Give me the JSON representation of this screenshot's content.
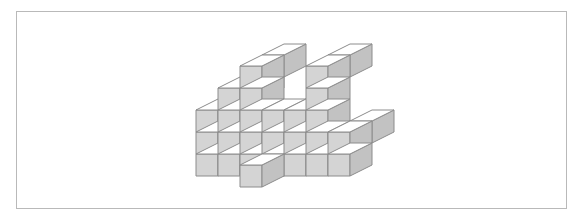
{
  "figure": {
    "title": "",
    "caption": "",
    "kind": "isometric-cube-stack",
    "frame": {
      "visible": true,
      "x": 16,
      "y": 11,
      "width": 551,
      "height": 198,
      "border_color": "#b9b9b9",
      "background": "#ffffff"
    },
    "palette": {
      "top_face": "#ffffff",
      "left_face": "#d4d4d4",
      "right_face": "#c2c2c2",
      "edge": "#8c8c8c",
      "page_background": "#ffffff"
    },
    "projection": {
      "type": "isometric",
      "cube_width_px": 22,
      "cube_height_px": 22,
      "depth_dx_px": 22,
      "depth_dy_px": -11,
      "origin_x_px": 196,
      "origin_y_px": 176
    },
    "cube_count": 38,
    "cubes": [
      {
        "x": 0,
        "y": 0,
        "z": 0
      },
      {
        "x": 0,
        "y": 0,
        "z": 1
      },
      {
        "x": 0,
        "y": 0,
        "z": 2
      },
      {
        "x": 1,
        "y": 0,
        "z": 0
      },
      {
        "x": 1,
        "y": 0,
        "z": 1
      },
      {
        "x": 1,
        "y": 0,
        "z": 2
      },
      {
        "x": 1,
        "y": 0,
        "z": 3
      },
      {
        "x": 2,
        "y": 0,
        "z": 0
      },
      {
        "x": 2,
        "y": 0,
        "z": 1
      },
      {
        "x": 2,
        "y": 0,
        "z": 2
      },
      {
        "x": 2,
        "y": 0,
        "z": 3
      },
      {
        "x": 2,
        "y": 0,
        "z": 4
      },
      {
        "x": 3,
        "y": 0,
        "z": 0
      },
      {
        "x": 3,
        "y": 0,
        "z": 1
      },
      {
        "x": 3,
        "y": 0,
        "z": 2
      },
      {
        "x": 4,
        "y": 0,
        "z": 0
      },
      {
        "x": 4,
        "y": 0,
        "z": 1
      },
      {
        "x": 4,
        "y": 0,
        "z": 2
      },
      {
        "x": 5,
        "y": 0,
        "z": 0
      },
      {
        "x": 5,
        "y": 0,
        "z": 1
      },
      {
        "x": 5,
        "y": 0,
        "z": 2
      },
      {
        "x": 5,
        "y": 0,
        "z": 3
      },
      {
        "x": 5,
        "y": 0,
        "z": 4
      },
      {
        "x": 6,
        "y": 0,
        "z": 0
      },
      {
        "x": 6,
        "y": 0,
        "z": 1
      },
      {
        "x": 3,
        "y": -1,
        "z": 0
      },
      {
        "x": 0,
        "y": 1,
        "z": 2
      },
      {
        "x": 1,
        "y": 1,
        "z": 3
      },
      {
        "x": 2,
        "y": 1,
        "z": 4
      },
      {
        "x": 5,
        "y": 1,
        "z": 4
      },
      {
        "x": 6,
        "y": 1,
        "z": 1
      }
    ],
    "columns": [
      {
        "label": "col-1",
        "height": 3
      },
      {
        "label": "col-2",
        "height": 4
      },
      {
        "label": "col-3",
        "height": 5
      },
      {
        "label": "col-4",
        "height": 3
      },
      {
        "label": "col-5",
        "height": 3
      },
      {
        "label": "col-6",
        "height": 5
      },
      {
        "label": "col-7",
        "height": 2
      }
    ]
  }
}
